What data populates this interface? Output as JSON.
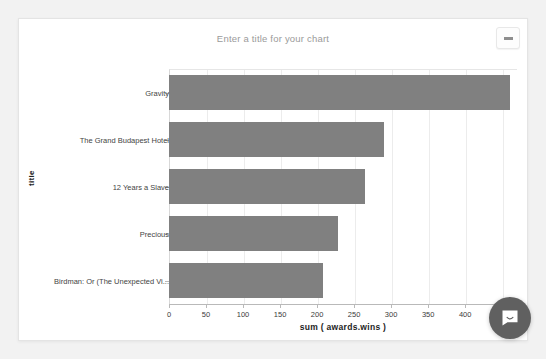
{
  "card": {
    "title_placeholder": "Enter a title for your chart",
    "menu_button_label": "",
    "menu_icon": "ellipsis-icon"
  },
  "chat": {
    "icon": "chat-bubble-icon",
    "label": ""
  },
  "colors": {
    "bar": "#808080",
    "grid": "#ececec",
    "axis": "#b9b9b9",
    "title_text": "#9a9a9a",
    "chat_bg": "#606060"
  },
  "chart_data": {
    "type": "bar",
    "orientation": "horizontal",
    "title": "Enter a title for your chart",
    "xlabel": "sum ( awards.wins )",
    "ylabel": "title",
    "categories": [
      "Gravity",
      "The Grand Budapest Hotel",
      "12 Years a Slave",
      "Precious",
      "Birdman: Or (The Unexpected Vi..."
    ],
    "values": [
      460,
      290,
      265,
      228,
      208
    ],
    "xlim": [
      0,
      470
    ],
    "xticks": [
      0,
      50,
      100,
      150,
      200,
      250,
      300,
      350,
      400,
      450
    ],
    "xticklabels": [
      "0",
      "50",
      "100",
      "150",
      "200",
      "250",
      "300",
      "350",
      "400",
      "450"
    ],
    "grid": true,
    "legend": false
  }
}
